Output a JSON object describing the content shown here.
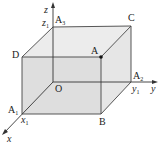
{
  "diagram": {
    "axes": {
      "x": "x",
      "y": "y",
      "z": "z"
    },
    "origin": "O",
    "vertices": {
      "A": "A",
      "A1": {
        "base": "A",
        "sub": "1"
      },
      "A2": {
        "base": "A",
        "sub": "2"
      },
      "A3": {
        "base": "A",
        "sub": "3"
      },
      "B": "B",
      "C": "C",
      "D": "D"
    },
    "axis_marks": {
      "x1": {
        "base": "x",
        "sub": "1"
      },
      "y1": {
        "base": "y",
        "sub": "1"
      },
      "z1": {
        "base": "z",
        "sub": "1"
      }
    },
    "colors": {
      "face_fill": "#e3e3e3",
      "line": "#333333",
      "point": "#111111"
    }
  }
}
